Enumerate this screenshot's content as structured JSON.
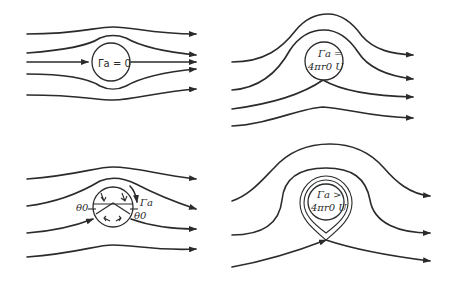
{
  "figure": {
    "panels": [
      {
        "id": "a",
        "position": "top-left",
        "label_line1": "Γa = 0",
        "description": "Uniform flow past cylinder with zero circulation; symmetric streamlines"
      },
      {
        "id": "b",
        "position": "bottom-left",
        "label_gamma": "Γa",
        "label_theta_left": "θ0",
        "label_theta_right": "θ0",
        "description": "Circulation less than critical; two stagnation points at angle θ0 below horizontal"
      },
      {
        "id": "c",
        "position": "top-right",
        "label_line1": "Γa =",
        "label_line2": "4πr0 U",
        "description": "Critical circulation; single stagnation point at bottom of cylinder"
      },
      {
        "id": "d",
        "position": "bottom-right",
        "label_line1": "Γa >",
        "label_line2": "4πr0 U",
        "description": "Circulation exceeds critical; stagnation point detached below cylinder with closed streamlines"
      }
    ],
    "colors": {
      "line": "#2b2b2b",
      "background": "#ffffff"
    }
  }
}
